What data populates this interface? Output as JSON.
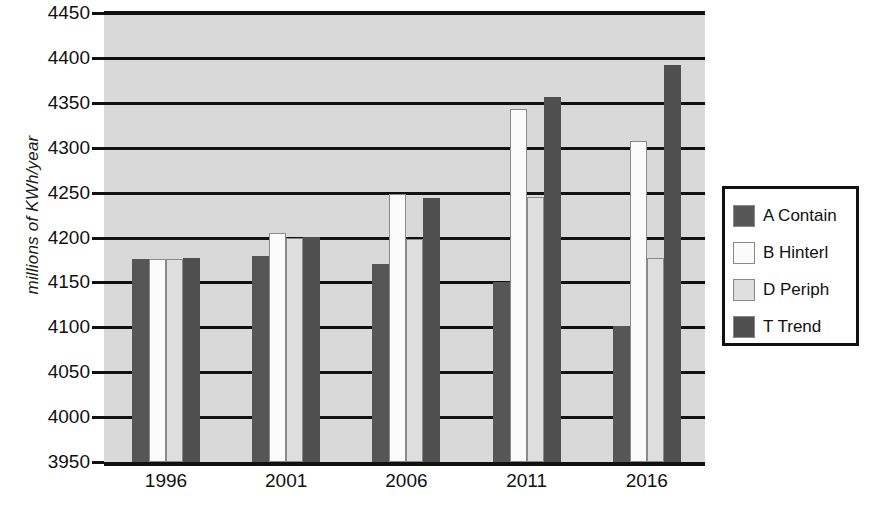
{
  "chart_data": {
    "type": "bar",
    "title": "",
    "xlabel": "",
    "ylabel": "millions of KWh/year",
    "categories": [
      "1996",
      "2001",
      "2006",
      "2011",
      "2016"
    ],
    "ylim": [
      3950,
      4450
    ],
    "ytick_step": 50,
    "yticks": [
      "4450",
      "4400",
      "4350",
      "4300",
      "4250",
      "4200",
      "4150",
      "4100",
      "4050",
      "4000",
      "3950"
    ],
    "grid": true,
    "legend_position": "right",
    "series": [
      {
        "name": "A Contain",
        "color": "#565656",
        "values": [
          4176,
          4179,
          4170,
          4151,
          4102
        ]
      },
      {
        "name": "B Hinterl",
        "color": "#fbfbfb",
        "values": [
          4176,
          4205,
          4249,
          4343,
          4308
        ]
      },
      {
        "name": "D Periph",
        "color": "#dededf",
        "values": [
          4176,
          4200,
          4198,
          4245,
          4177
        ]
      },
      {
        "name": "T Trend",
        "color": "#4f4f4f",
        "values": [
          4177,
          4201,
          4244,
          4357,
          4392
        ]
      }
    ]
  },
  "legend": {
    "items": [
      {
        "label": "A Contain",
        "color": "#565656"
      },
      {
        "label": "B Hinterl",
        "color": "#fbfbfb"
      },
      {
        "label": "D Periph",
        "color": "#dededf"
      },
      {
        "label": "T Trend",
        "color": "#4f4f4f"
      }
    ]
  },
  "axis": {
    "y_title": "millions of KWh/year"
  }
}
